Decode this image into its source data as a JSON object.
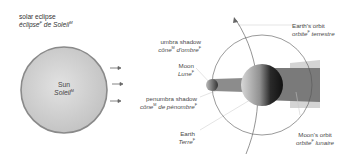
{
  "title": {
    "en": "solar eclipse",
    "fr": "éclipse",
    "fr_gender": "F",
    "fr_rest": " de Soleil",
    "fr_rest_gender": "M"
  },
  "sun": {
    "en": "Sun",
    "fr": "Soleil",
    "gender": "M"
  },
  "umbra": {
    "en": "umbra shadow",
    "fr1": "cône",
    "g1": "M",
    "fr2": " d'ombre",
    "g2": "F"
  },
  "moon": {
    "en": "Moon",
    "fr": "Lune",
    "gender": "F"
  },
  "penumbra": {
    "en": "penumbra shadow",
    "fr1": "cône",
    "g1": "M",
    "fr2": " de pénombre",
    "g2": "F"
  },
  "earth": {
    "en": "Earth",
    "fr": "Terre",
    "gender": "F"
  },
  "earth_orbit": {
    "en": "Earth's orbit",
    "fr1": "orbite",
    "g1": "F",
    "fr2": " terrestre"
  },
  "moon_orbit": {
    "en": "Moon's orbit",
    "fr1": "orbite",
    "g1": "F",
    "fr2": " lunaire"
  },
  "colors": {
    "sun_fill": "#cfcfcf",
    "sun_border": "#8a8a8a",
    "umbra": "#707070",
    "penumbra": "#c8c8c8",
    "orbit": "#555555",
    "leader": "#bbbbbb"
  }
}
